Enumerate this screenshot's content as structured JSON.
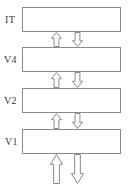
{
  "diagram": {
    "canvas": {
      "width": 131,
      "height": 189
    },
    "style": {
      "box_stroke": "#8a8a8a",
      "box_fill": "#ffffff",
      "arrow_stroke": "#8a8a8a",
      "arrow_fill": "#ffffff",
      "label_color": "#3a3a3a",
      "background": "#ffffff"
    },
    "levels": [
      {
        "id": "it",
        "label": "IT",
        "label_x": 5,
        "label_y": 15,
        "box_x": 22,
        "box_y": 7,
        "box_w": 99,
        "box_h": 25
      },
      {
        "id": "v4",
        "label": "V4",
        "label_x": 4,
        "label_y": 55,
        "box_x": 22,
        "box_y": 47,
        "box_w": 99,
        "box_h": 25
      },
      {
        "id": "v2",
        "label": "V2",
        "label_x": 4,
        "label_y": 96,
        "box_x": 22,
        "box_y": 88,
        "box_w": 99,
        "box_h": 25
      },
      {
        "id": "v1",
        "label": "V1",
        "label_x": 5,
        "label_y": 137,
        "box_x": 22,
        "box_y": 129,
        "box_w": 99,
        "box_h": 25
      }
    ],
    "connections": [
      {
        "id": "v4-to-it",
        "direction": "up",
        "role": "feedforward",
        "x": 51,
        "y": 32,
        "w": 11,
        "h": 15
      },
      {
        "id": "it-to-v4",
        "direction": "down",
        "role": "feedback",
        "x": 72,
        "y": 32,
        "w": 11,
        "h": 15
      },
      {
        "id": "v2-to-v4",
        "direction": "up",
        "role": "feedforward",
        "x": 51,
        "y": 72,
        "w": 11,
        "h": 16
      },
      {
        "id": "v4-to-v2",
        "direction": "down",
        "role": "feedback",
        "x": 72,
        "y": 72,
        "w": 11,
        "h": 16
      },
      {
        "id": "v1-to-v2",
        "direction": "up",
        "role": "feedforward",
        "x": 51,
        "y": 113,
        "w": 11,
        "h": 16
      },
      {
        "id": "v2-to-v1",
        "direction": "down",
        "role": "feedback",
        "x": 72,
        "y": 113,
        "w": 11,
        "h": 16
      },
      {
        "id": "input-to-v1",
        "direction": "up",
        "role": "input",
        "x": 50,
        "y": 154,
        "w": 13,
        "h": 30
      },
      {
        "id": "v1-to-output",
        "direction": "down",
        "role": "output",
        "x": 71,
        "y": 154,
        "w": 13,
        "h": 30
      }
    ]
  }
}
